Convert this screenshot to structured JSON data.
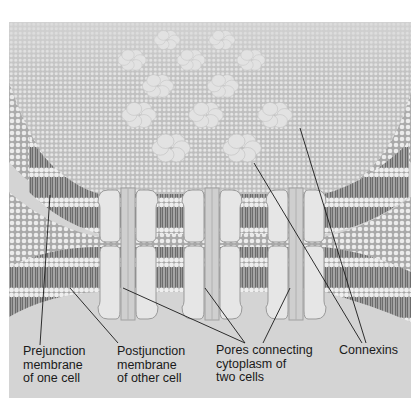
{
  "figure": {
    "colors": {
      "frame_background": "#d4d4d4",
      "membrane_surface": "#b9b9b9",
      "lipid_head": "#ececec",
      "lipid_tail": "#7a7a7a",
      "connexon": "#e2e2e2",
      "channel": "#e6e6e6",
      "channel_outline": "#9a9a9a",
      "leader_line": "#1a1a1a",
      "text": "#1a1a1a"
    }
  },
  "labels": {
    "prejunction": "Prejunction\nmembrane\nof one cell",
    "postjunction": "Postjunction\nmembrane\nof other cell",
    "pores": "Pores connecting\ncytoplasm of\ntwo cells",
    "connexins": "Connexins"
  },
  "connexon_clusters": [
    {
      "cx": 158,
      "cy": 18
    },
    {
      "cx": 213,
      "cy": 18
    },
    {
      "cx": 123,
      "cy": 38
    },
    {
      "cx": 182,
      "cy": 38
    },
    {
      "cx": 242,
      "cy": 38
    },
    {
      "cx": 149,
      "cy": 64
    },
    {
      "cx": 214,
      "cy": 64
    },
    {
      "cx": 130,
      "cy": 93
    },
    {
      "cx": 197,
      "cy": 93
    },
    {
      "cx": 266,
      "cy": 93
    },
    {
      "cx": 162,
      "cy": 126
    },
    {
      "cx": 233,
      "cy": 126
    }
  ],
  "channels": [
    {
      "cx": 119
    },
    {
      "cx": 203
    },
    {
      "cx": 287
    }
  ]
}
